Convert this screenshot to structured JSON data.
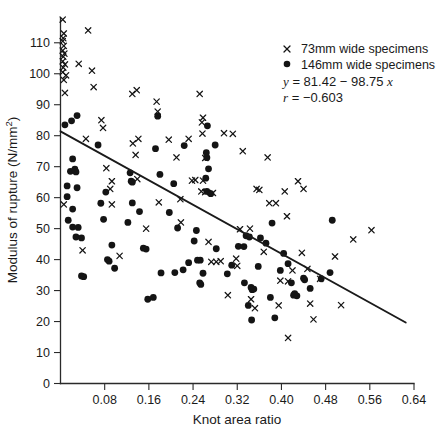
{
  "chart_data": {
    "type": "scatter",
    "title": "",
    "xlabel": "Knot area ratio",
    "ylabel": "Modulus of rupture (N/mm2)",
    "ylabel_display": "Modulus of rupture (N/mm²)",
    "xlim": [
      0,
      0.64
    ],
    "ylim": [
      0,
      118
    ],
    "grid": false,
    "legend_position": "top-right",
    "xticks": [
      0.08,
      0.16,
      0.24,
      0.32,
      0.4,
      0.48,
      0.56,
      0.64
    ],
    "xtick_labels": [
      "0.08",
      "0.16",
      "0.24",
      "0.32",
      "0.40",
      "0.48",
      "0.56",
      "0.64"
    ],
    "yticks": [
      0,
      10,
      20,
      30,
      40,
      50,
      60,
      70,
      80,
      90,
      100,
      110
    ],
    "ytick_labels": [
      "0",
      "10",
      "20",
      "30",
      "40",
      "50",
      "60",
      "70",
      "80",
      "90",
      "100",
      "110"
    ],
    "annotations": [
      "y = 81.42 - 98.75 x",
      "r = -0.603"
    ],
    "fit_line": {
      "name": "least-squares regression line",
      "intercept": 81.42,
      "slope": -98.75,
      "equation_display": "y = 81.42 − 98.75 x",
      "correlation": -0.603,
      "correlation_display": "r = −0.603",
      "x_start": 0.0,
      "x_end": 0.625
    },
    "series": [
      {
        "name": "73mm wide specimens",
        "label": "73 mm wide specimens",
        "marker": "cross",
        "color": "#141414",
        "points": [
          [
            0.004,
            117.5
          ],
          [
            0.006,
            113.0
          ],
          [
            0.005,
            111.5
          ],
          [
            0.004,
            110.5
          ],
          [
            0.006,
            109.0
          ],
          [
            0.004,
            107.5
          ],
          [
            0.007,
            106.5
          ],
          [
            0.005,
            105.5
          ],
          [
            0.004,
            104.0
          ],
          [
            0.008,
            103.0
          ],
          [
            0.005,
            102.0
          ],
          [
            0.004,
            100.5
          ],
          [
            0.01,
            99.5
          ],
          [
            0.006,
            98.0
          ],
          [
            0.008,
            93.8
          ],
          [
            0.006,
            57.8
          ],
          [
            0.05,
            114.0
          ],
          [
            0.033,
            103.2
          ],
          [
            0.057,
            101.0
          ],
          [
            0.06,
            95.7
          ],
          [
            0.046,
            79.0
          ],
          [
            0.04,
            43.0
          ],
          [
            0.074,
            85.0
          ],
          [
            0.077,
            82.5
          ],
          [
            0.083,
            69.5
          ],
          [
            0.09,
            62.8
          ],
          [
            0.093,
            65.3
          ],
          [
            0.093,
            57.8
          ],
          [
            0.107,
            41.2
          ],
          [
            0.13,
            93.5
          ],
          [
            0.138,
            94.7
          ],
          [
            0.131,
            77.5
          ],
          [
            0.141,
            79.0
          ],
          [
            0.136,
            73.8
          ],
          [
            0.139,
            66.0
          ],
          [
            0.155,
            50.0
          ],
          [
            0.174,
            91.0
          ],
          [
            0.176,
            87.8
          ],
          [
            0.178,
            58.5
          ],
          [
            0.196,
            78.7
          ],
          [
            0.21,
            73.0
          ],
          [
            0.218,
            52.0
          ],
          [
            0.217,
            59.5
          ],
          [
            0.232,
            79.0
          ],
          [
            0.238,
            65.5
          ],
          [
            0.244,
            65.7
          ],
          [
            0.252,
            93.5
          ],
          [
            0.258,
            85.8
          ],
          [
            0.256,
            84.3
          ],
          [
            0.257,
            80.7
          ],
          [
            0.262,
            72.8
          ],
          [
            0.258,
            65.5
          ],
          [
            0.255,
            62.0
          ],
          [
            0.262,
            61.8
          ],
          [
            0.268,
            45.7
          ],
          [
            0.276,
            61.5
          ],
          [
            0.273,
            39.3
          ],
          [
            0.282,
            39.3
          ],
          [
            0.29,
            39.5
          ],
          [
            0.296,
            80.8
          ],
          [
            0.303,
            28.5
          ],
          [
            0.312,
            80.6
          ],
          [
            0.318,
            40.3
          ],
          [
            0.32,
            38.0
          ],
          [
            0.325,
            49.8
          ],
          [
            0.33,
            75.0
          ],
          [
            0.343,
            50.0
          ],
          [
            0.345,
            27.2
          ],
          [
            0.355,
            62.8
          ],
          [
            0.352,
            24.3
          ],
          [
            0.36,
            62.5
          ],
          [
            0.368,
            42.5
          ],
          [
            0.375,
            73.0
          ],
          [
            0.378,
            58.2
          ],
          [
            0.39,
            58.2
          ],
          [
            0.395,
            25.2
          ],
          [
            0.398,
            33.2
          ],
          [
            0.406,
            62.0
          ],
          [
            0.41,
            54.0
          ],
          [
            0.412,
            33.0
          ],
          [
            0.412,
            14.7
          ],
          [
            0.42,
            36.5
          ],
          [
            0.43,
            65.3
          ],
          [
            0.437,
            42.2
          ],
          [
            0.44,
            62.8
          ],
          [
            0.447,
            37.0
          ],
          [
            0.452,
            25.8
          ],
          [
            0.458,
            20.7
          ],
          [
            0.47,
            33.8
          ],
          [
            0.497,
            41.0
          ],
          [
            0.508,
            25.3
          ],
          [
            0.53,
            46.5
          ],
          [
            0.563,
            49.5
          ]
        ]
      },
      {
        "name": "146mm wide specimens",
        "label": "146 mm wide specimens",
        "marker": "circle",
        "color": "#141414",
        "points": [
          [
            0.008,
            83.5
          ],
          [
            0.02,
            84.8
          ],
          [
            0.03,
            86.5
          ],
          [
            0.022,
            72.5
          ],
          [
            0.018,
            68.5
          ],
          [
            0.026,
            69.2
          ],
          [
            0.028,
            68.3
          ],
          [
            0.012,
            63.8
          ],
          [
            0.012,
            60.3
          ],
          [
            0.03,
            63.2
          ],
          [
            0.022,
            56.3
          ],
          [
            0.014,
            52.7
          ],
          [
            0.022,
            50.5
          ],
          [
            0.032,
            50.4
          ],
          [
            0.028,
            47.3
          ],
          [
            0.038,
            47.0
          ],
          [
            0.038,
            34.7
          ],
          [
            0.042,
            34.5
          ],
          [
            0.068,
            77.0
          ],
          [
            0.073,
            58.2
          ],
          [
            0.082,
            61.8
          ],
          [
            0.085,
            40.0
          ],
          [
            0.088,
            39.5
          ],
          [
            0.078,
            53.0
          ],
          [
            0.093,
            44.7
          ],
          [
            0.098,
            37.2
          ],
          [
            0.126,
            68.0
          ],
          [
            0.128,
            65.3
          ],
          [
            0.13,
            65.0
          ],
          [
            0.13,
            58.3
          ],
          [
            0.122,
            52.0
          ],
          [
            0.15,
            43.7
          ],
          [
            0.155,
            43.4
          ],
          [
            0.143,
            55.5
          ],
          [
            0.158,
            27.2
          ],
          [
            0.168,
            27.8
          ],
          [
            0.176,
            86.3
          ],
          [
            0.172,
            75.8
          ],
          [
            0.18,
            67.5
          ],
          [
            0.182,
            35.7
          ],
          [
            0.197,
            55.2
          ],
          [
            0.205,
            64.5
          ],
          [
            0.207,
            35.8
          ],
          [
            0.212,
            50.2
          ],
          [
            0.224,
            76.8
          ],
          [
            0.222,
            36.7
          ],
          [
            0.232,
            39.0
          ],
          [
            0.246,
            49.4
          ],
          [
            0.242,
            46.0
          ],
          [
            0.248,
            39.8
          ],
          [
            0.253,
            39.8
          ],
          [
            0.252,
            32.5
          ],
          [
            0.254,
            32.0
          ],
          [
            0.258,
            35.6
          ],
          [
            0.265,
            72.9
          ],
          [
            0.264,
            74.5
          ],
          [
            0.266,
            83.2
          ],
          [
            0.268,
            69.3
          ],
          [
            0.263,
            66.3
          ],
          [
            0.265,
            62.0
          ],
          [
            0.272,
            61.3
          ],
          [
            0.28,
            77.0
          ],
          [
            0.282,
            43.5
          ],
          [
            0.302,
            35.4
          ],
          [
            0.31,
            38.2
          ],
          [
            0.322,
            44.3
          ],
          [
            0.332,
            44.2
          ],
          [
            0.333,
            32.5
          ],
          [
            0.336,
            47.7
          ],
          [
            0.34,
            25.2
          ],
          [
            0.342,
            47.3
          ],
          [
            0.345,
            31.0
          ],
          [
            0.347,
            30.3
          ],
          [
            0.35,
            30.5
          ],
          [
            0.346,
            20.5
          ],
          [
            0.358,
            37.8
          ],
          [
            0.362,
            47.0
          ],
          [
            0.372,
            45.3
          ],
          [
            0.38,
            27.8
          ],
          [
            0.383,
            51.8
          ],
          [
            0.388,
            21.2
          ],
          [
            0.398,
            36.5
          ],
          [
            0.404,
            42.0
          ],
          [
            0.412,
            38.7
          ],
          [
            0.418,
            32.5
          ],
          [
            0.422,
            28.5
          ],
          [
            0.424,
            29.0
          ],
          [
            0.428,
            28.3
          ],
          [
            0.44,
            34.0
          ],
          [
            0.442,
            33.5
          ],
          [
            0.452,
            30.7
          ],
          [
            0.472,
            33.8
          ],
          [
            0.488,
            35.8
          ],
          [
            0.492,
            52.7
          ]
        ]
      }
    ]
  },
  "legend": {
    "entries": [
      {
        "marker": "cross-marker",
        "label": "73mm wide specimens"
      },
      {
        "marker": "circle-marker",
        "label": "146mm wide specimens"
      }
    ],
    "equation": "y = 81.42 − 98.75 x",
    "equation_parts": {
      "y": "y",
      "body": " = 81.42 − 98.75 ",
      "x": "x"
    },
    "correlation": "r = −0.603",
    "correlation_parts": {
      "r": "r",
      "value": " = −0.603"
    }
  },
  "colors": {
    "marker": "#141414",
    "axis": "#2a2a2a",
    "line": "#1a1a1a",
    "background": "#ffffff"
  }
}
